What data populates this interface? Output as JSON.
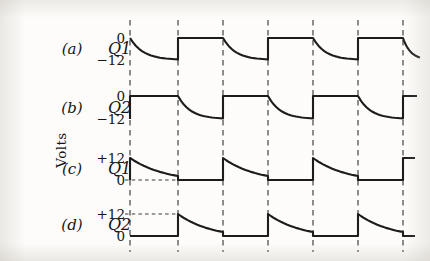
{
  "figure": {
    "axis_label": "Volts",
    "gridlines_x": [
      130,
      178,
      223,
      268,
      313,
      358,
      403
    ],
    "plot_left": 130,
    "plot_right": 403,
    "ink_color": "#1c1c1c",
    "grid_color": "#4a4a4a",
    "background_color": "#fdfcfa"
  },
  "traces": [
    {
      "index_label": "(a)",
      "signal_label": "Q1",
      "high_tick": "0",
      "low_tick": "−12",
      "high_value": 0,
      "low_value": -12,
      "y_high": 38,
      "y_low": 60,
      "waveform": "square-with-exponential-decay",
      "phase": "starts-high-decays",
      "has_ref_dash": false,
      "ref_dash_level": null
    },
    {
      "index_label": "(b)",
      "signal_label": "Q2",
      "high_tick": "0",
      "low_tick": "−12",
      "high_value": 0,
      "low_value": -12,
      "y_high": 96,
      "y_low": 119,
      "waveform": "square-with-exponential-decay",
      "phase": "starts-low-rises",
      "has_ref_dash": false,
      "ref_dash_level": null
    },
    {
      "index_label": "(c)",
      "signal_label": "Q1",
      "high_tick": "+12",
      "low_tick": "0",
      "high_value": 12,
      "low_value": 0,
      "y_high": 158,
      "y_low": 180,
      "waveform": "sawtooth-ramp-down",
      "phase": "ramp-first-half",
      "has_ref_dash": true,
      "ref_dash_level": "low"
    },
    {
      "index_label": "(d)",
      "signal_label": "Q2",
      "high_tick": "+12",
      "low_tick": "0",
      "high_value": 12,
      "low_value": 0,
      "y_high": 214,
      "y_low": 236,
      "waveform": "sawtooth-ramp-down",
      "phase": "ramp-second-half",
      "has_ref_dash": true,
      "ref_dash_level": "high"
    }
  ],
  "chart_data": {
    "type": "line",
    "title": "",
    "xlabel": "",
    "ylabel": "Volts",
    "grid": true,
    "legend": "none",
    "x": [
      130,
      178,
      223,
      268,
      313,
      358,
      403
    ],
    "series": [
      {
        "name": "(a) Q1",
        "ylim": [
          -12,
          0
        ],
        "tick_labels": [
          "0",
          "−12"
        ],
        "shape": "square wave, 0 V high / −12 V low, falling edges rounded by RC exponential decay, rising edges vertical; half-period = one gridline interval; begins high at first gridline then decays"
      },
      {
        "name": "(b) Q2",
        "ylim": [
          -12,
          0
        ],
        "tick_labels": [
          "0",
          "−12"
        ],
        "shape": "complement of (a): square wave 0 V / −12 V offset by one half-period; begins with vertical rise to 0 V, holds, then exponential decay to −12 V"
      },
      {
        "name": "(c) Q1",
        "ylim": [
          0,
          12
        ],
        "tick_labels": [
          "+12",
          "0"
        ],
        "shape": "sawtooth: vertical rise to +12 V at gridline, gentle concave ramp down toward 0 V over one interval, step to 0 V, flat for one interval, repeat"
      },
      {
        "name": "(d) Q2",
        "ylim": [
          0,
          12
        ],
        "tick_labels": [
          "+12",
          "0"
        ],
        "shape": "same sawtooth as (c) delayed by one gridline interval; flat at 0 V first, then vertical rise to +12 V and ramp down"
      }
    ]
  }
}
